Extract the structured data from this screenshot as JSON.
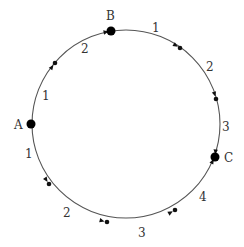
{
  "diagram": {
    "type": "circular-path-graph",
    "circle": {
      "cx": 126,
      "cy": 124,
      "r": 94,
      "stroke": "#555555"
    },
    "nodes": [
      {
        "id": "A",
        "label": "A",
        "x": 31,
        "y": 124,
        "lx": 14,
        "ly": 129
      },
      {
        "id": "B",
        "label": "B",
        "x": 111,
        "y": 31,
        "lx": 106,
        "ly": 20
      },
      {
        "id": "C",
        "label": "C",
        "x": 215,
        "y": 157,
        "lx": 224,
        "ly": 162
      }
    ],
    "waypoints": [
      {
        "x": 55,
        "y": 63,
        "arrow_from": [
          49,
          71
        ]
      },
      {
        "x": 180,
        "y": 48,
        "arrow_from": [
          172,
          43
        ]
      },
      {
        "x": 216,
        "y": 99,
        "arrow_from": [
          214,
          92
        ]
      },
      {
        "x": 49,
        "y": 184,
        "arrow_from": [
          45,
          178
        ]
      },
      {
        "x": 107,
        "y": 222,
        "arrow_from": [
          99,
          220
        ]
      },
      {
        "x": 175,
        "y": 210,
        "arrow_from": [
          168,
          214
        ]
      }
    ],
    "node_arrows": [
      {
        "to": "B",
        "arrow_from": [
          101,
          33
        ]
      },
      {
        "to": "C",
        "arrow_from": [
          216,
          146
        ]
      },
      {
        "to": "C",
        "arrow_from": [
          210,
          166
        ]
      }
    ],
    "edge_labels": [
      {
        "text": "2",
        "x": 81,
        "y": 53
      },
      {
        "text": "1",
        "x": 42,
        "y": 100
      },
      {
        "text": "1",
        "x": 152,
        "y": 32
      },
      {
        "text": "2",
        "x": 206,
        "y": 71
      },
      {
        "text": "3",
        "x": 222,
        "y": 131
      },
      {
        "text": "1",
        "x": 25,
        "y": 158
      },
      {
        "text": "2",
        "x": 63,
        "y": 217
      },
      {
        "text": "3",
        "x": 138,
        "y": 237
      },
      {
        "text": "4",
        "x": 199,
        "y": 201
      }
    ]
  }
}
